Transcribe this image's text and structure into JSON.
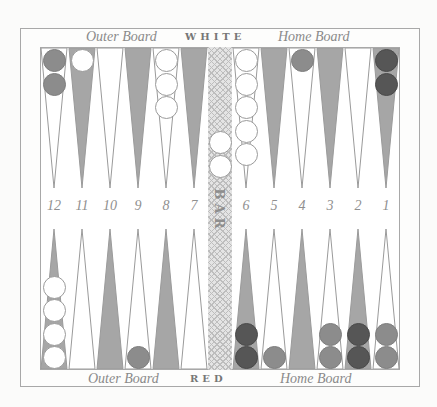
{
  "board": {
    "top_labels": {
      "left": "Outer Board",
      "center": "WHITE",
      "right": "Home Board"
    },
    "bottom_labels": {
      "left": "Outer Board",
      "center": "RED",
      "right": "Home Board"
    },
    "bar_label": "BAR",
    "point_numbers": [
      "12",
      "11",
      "10",
      "9",
      "8",
      "7",
      "6",
      "5",
      "4",
      "3",
      "2",
      "1"
    ],
    "colors": {
      "shaded_point": "#a6a6a6",
      "light_point": "#ffffff",
      "white_checker": "#ffffff",
      "red_checker_light": "#8c8c8c",
      "red_checker_dark": "#565656",
      "frame": "#a8a8a8"
    },
    "top_points": [
      {
        "index": 12,
        "shade": "light",
        "checkers": [
          {
            "color": "red-light"
          },
          {
            "color": "red-light"
          }
        ]
      },
      {
        "index": 11,
        "shade": "dark",
        "checkers": [
          {
            "color": "white"
          }
        ]
      },
      {
        "index": 10,
        "shade": "light",
        "checkers": []
      },
      {
        "index": 9,
        "shade": "dark",
        "checkers": []
      },
      {
        "index": 8,
        "shade": "light",
        "checkers": [
          {
            "color": "white"
          },
          {
            "color": "white"
          },
          {
            "color": "white"
          }
        ]
      },
      {
        "index": 7,
        "shade": "dark",
        "checkers": []
      },
      {
        "index": 6,
        "shade": "light",
        "checkers": [
          {
            "color": "white"
          },
          {
            "color": "white"
          },
          {
            "color": "white"
          },
          {
            "color": "white"
          },
          {
            "color": "white"
          }
        ]
      },
      {
        "index": 5,
        "shade": "dark",
        "checkers": []
      },
      {
        "index": 4,
        "shade": "light",
        "checkers": [
          {
            "color": "red-light"
          }
        ]
      },
      {
        "index": 3,
        "shade": "dark",
        "checkers": []
      },
      {
        "index": 2,
        "shade": "light",
        "checkers": []
      },
      {
        "index": 1,
        "shade": "dark",
        "checkers": [
          {
            "color": "red-dark"
          },
          {
            "color": "red-dark"
          }
        ]
      }
    ],
    "bottom_points": [
      {
        "index": 12,
        "shade": "dark",
        "checkers": [
          {
            "color": "white"
          },
          {
            "color": "white"
          },
          {
            "color": "white"
          },
          {
            "color": "white"
          }
        ]
      },
      {
        "index": 11,
        "shade": "light",
        "checkers": []
      },
      {
        "index": 10,
        "shade": "dark",
        "checkers": []
      },
      {
        "index": 9,
        "shade": "light",
        "checkers": [
          {
            "color": "red-light"
          }
        ]
      },
      {
        "index": 8,
        "shade": "dark",
        "checkers": []
      },
      {
        "index": 7,
        "shade": "light",
        "checkers": []
      },
      {
        "index": 6,
        "shade": "dark",
        "checkers": [
          {
            "color": "red-dark"
          },
          {
            "color": "red-dark"
          }
        ]
      },
      {
        "index": 5,
        "shade": "light",
        "checkers": [
          {
            "color": "red-light"
          }
        ]
      },
      {
        "index": 4,
        "shade": "dark",
        "checkers": []
      },
      {
        "index": 3,
        "shade": "light",
        "checkers": [
          {
            "color": "red-light"
          },
          {
            "color": "red-light"
          }
        ]
      },
      {
        "index": 2,
        "shade": "dark",
        "checkers": [
          {
            "color": "red-dark"
          },
          {
            "color": "red-dark"
          }
        ]
      },
      {
        "index": 1,
        "shade": "light",
        "checkers": [
          {
            "color": "red-light"
          },
          {
            "color": "red-light"
          }
        ]
      }
    ],
    "bar": {
      "white_checkers": 2,
      "red_checkers": 0
    }
  }
}
